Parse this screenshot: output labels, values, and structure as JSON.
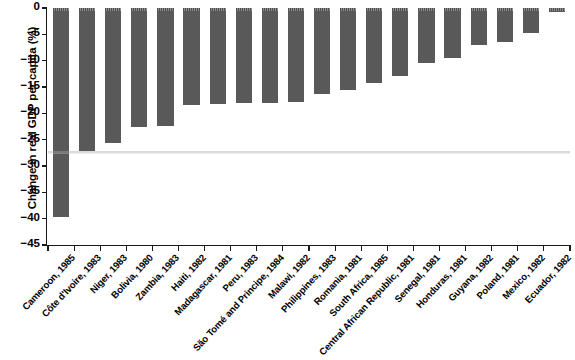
{
  "chart_data": {
    "type": "bar",
    "title": "",
    "xlabel": "",
    "ylabel": "Change in real GDP per capita (%)",
    "ylim": [
      -45,
      0
    ],
    "yticks": [
      0,
      -5,
      -10,
      -15,
      -20,
      -25,
      -30,
      -35,
      -40,
      -45
    ],
    "ytick_labels": [
      "0",
      "−5",
      "−10",
      "−15",
      "−20",
      "−25",
      "−30",
      "−35",
      "−40",
      "−45"
    ],
    "grid": false,
    "legend": null,
    "bar_color": "#595959",
    "categories": [
      "Cameroon, 1985",
      "Côte d'Ivoire, 1983",
      "Niger, 1983",
      "Bolivia, 1980",
      "Zambia, 1983",
      "Haiti, 1982",
      "Madagascar, 1981",
      "Peru, 1983",
      "São Tomé and Principe, 1984",
      "Malawi, 1982",
      "Philippines, 1983",
      "Romania, 1981",
      "South Africa, 1985",
      "Central African Republic, 1981",
      "Senegal, 1981",
      "Honduras, 1981",
      "Guyana, 1982",
      "Poland, 1981",
      "Mexico, 1982",
      "Ecuador, 1982"
    ],
    "values": [
      -39.6,
      -27.1,
      -25.7,
      -22.6,
      -22.4,
      -18.5,
      -18.2,
      -18.1,
      -18.0,
      -17.8,
      -16.3,
      -15.6,
      -14.2,
      -12.9,
      -10.4,
      -9.5,
      -7.0,
      -6.4,
      -4.7,
      -0.8
    ]
  }
}
